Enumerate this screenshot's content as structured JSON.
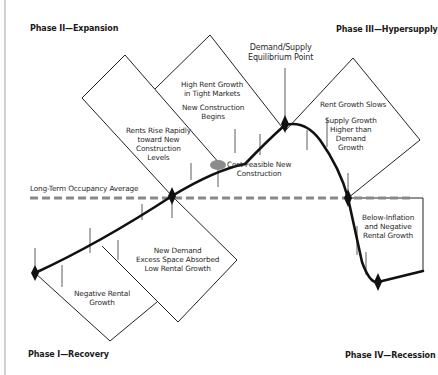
{
  "phases": {
    "phase1": "Phase I—Recovery",
    "phase2": "Phase II—Expansion",
    "phase3": "Phase III—Hypersupply",
    "phase4": "Phase IV—Recession"
  },
  "reference_line": {
    "label": "Long-Term Occupancy Average",
    "color": "#8a8a8a"
  },
  "callouts": {
    "equilibrium": [
      "Demand/Supply",
      "Equilibrium Point"
    ],
    "cost_feasible": [
      "Cost-Feasible New",
      "Construction"
    ],
    "high_rent": [
      "High Rent Growth",
      "in Tight Markets"
    ],
    "new_construction": [
      "New Construction",
      "Begins"
    ],
    "rents_rise": [
      "Rents Rise Rapidly",
      "toward New",
      "Construction",
      "Levels"
    ],
    "rent_slows": [
      "Rent Growth Slows"
    ],
    "supply_growth": [
      "Supply Growth",
      "Higher than",
      "Demand",
      "Growth"
    ],
    "new_demand": [
      "New Demand",
      "Excess Space Absorbed",
      "Low Rental Growth"
    ],
    "negative_rental": [
      "Negative Rental",
      "Growth"
    ],
    "below_inflation": [
      "Below-Inflation",
      "and Negative",
      "Rental Growth"
    ]
  },
  "colors": {
    "curve": "#111111",
    "marker_ellipse": "#8c8c8c",
    "box_stroke": "#222222",
    "frame": "#b5b5b5"
  }
}
